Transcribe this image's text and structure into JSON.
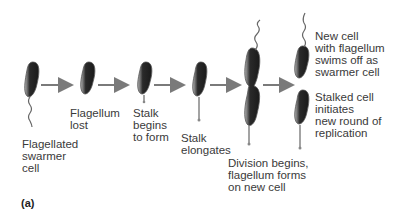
{
  "diagram": {
    "type": "caulobacter-cell-cycle",
    "panel_label": "(a)",
    "stages": [
      {
        "id": "swarmer",
        "label": "Flagellated\nswarmer\ncell"
      },
      {
        "id": "flagellum-lost",
        "label": "Flagellum\nlost"
      },
      {
        "id": "stalk-begins",
        "label": "Stalk\nbegins\nto form"
      },
      {
        "id": "stalk-elongates",
        "label": "Stalk\nelongates"
      },
      {
        "id": "division",
        "label": "Division begins,\nflagellum forms\non new cell"
      },
      {
        "id": "new-cell",
        "label": "New cell\nwith flagellum\nswims off as\nswarmer cell"
      },
      {
        "id": "stalked-cell",
        "label": "Stalked cell\ninitiates\nnew round of\nreplication"
      }
    ],
    "colors": {
      "arrow": "#7a7a7a",
      "cell_dark": "#2a2a2a",
      "cell_light": "#9a9a9a",
      "text": "#3a3a3a"
    }
  }
}
